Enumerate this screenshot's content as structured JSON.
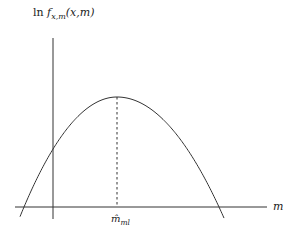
{
  "diagram": {
    "y_axis_label": {
      "prefix": "ln ",
      "func": "f",
      "subscript": "x,m",
      "args": "(x,m)"
    },
    "x_axis_label": "m",
    "peak_label": {
      "base": "m̂",
      "subscript": "ml"
    },
    "curve": {
      "type": "concave parabola",
      "description": "log-likelihood as a function of m with maximum at the ML estimate"
    }
  }
}
